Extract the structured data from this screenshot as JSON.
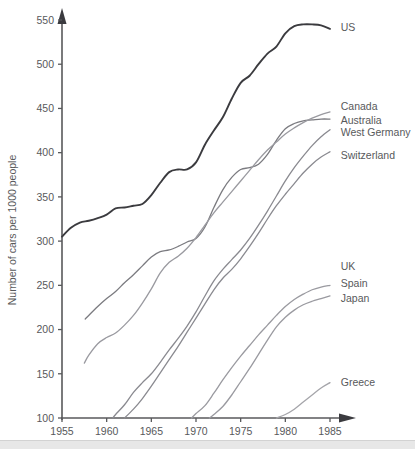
{
  "chart_data": {
    "type": "line",
    "title": "",
    "xlabel": "",
    "ylabel": "Number of cars per 1000 people",
    "xlim": [
      1955,
      1986
    ],
    "ylim": [
      100,
      550
    ],
    "xticks": [
      1955,
      1960,
      1965,
      1970,
      1975,
      1980,
      1985
    ],
    "yticks": [
      100,
      150,
      200,
      250,
      300,
      350,
      400,
      450,
      500,
      550
    ],
    "grid": false,
    "legend_position": "right-inline-labels",
    "series": [
      {
        "name": "US",
        "color": "#3b3b3f",
        "width": 1.9,
        "label_x": 1986.2,
        "label_y": 542,
        "x": [
          1955,
          1956,
          1957,
          1958,
          1959,
          1960,
          1961,
          1962,
          1963,
          1964,
          1965,
          1966,
          1967,
          1968,
          1969,
          1970,
          1971,
          1972,
          1973,
          1974,
          1975,
          1976,
          1977,
          1978,
          1979,
          1980,
          1981,
          1982,
          1983,
          1984,
          1985
        ],
        "y": [
          305,
          315,
          321,
          323,
          326,
          330,
          337,
          338,
          340,
          342,
          352,
          366,
          378,
          381,
          381,
          389,
          409,
          425,
          440,
          461,
          479,
          487,
          500,
          512,
          520,
          535,
          543,
          545,
          545,
          544,
          540
        ]
      },
      {
        "name": "Canada",
        "color": "#7b7b80",
        "width": 1.3,
        "label_x": 1986.2,
        "label_y": 452,
        "x": [
          1957.6,
          1959,
          1960,
          1961,
          1962,
          1963,
          1964,
          1965,
          1966,
          1967,
          1968,
          1969,
          1970,
          1971,
          1972,
          1973,
          1974,
          1975,
          1976,
          1977,
          1978,
          1979,
          1980,
          1981,
          1982,
          1983,
          1984,
          1985
        ],
        "y": [
          212,
          226,
          235,
          243,
          253,
          262,
          272,
          282,
          288,
          290,
          294,
          299,
          303,
          316,
          338,
          358,
          372,
          381,
          383,
          387,
          398,
          414,
          427,
          433,
          436,
          437,
          438,
          438
        ]
      },
      {
        "name": "Australia",
        "color": "#9a9aa0",
        "width": 1.3,
        "label_x": 1986.2,
        "label_y": 437,
        "x": [
          1957.5,
          1958,
          1959,
          1960,
          1961,
          1962,
          1963,
          1964,
          1965,
          1966,
          1967,
          1968,
          1969,
          1970,
          1971,
          1972,
          1973,
          1974,
          1975,
          1976,
          1977,
          1978,
          1979,
          1980,
          1981,
          1982,
          1983,
          1984,
          1985
        ],
        "y": [
          162,
          171,
          184,
          191,
          196,
          205,
          216,
          230,
          246,
          264,
          276,
          283,
          292,
          304,
          318,
          332,
          344,
          356,
          368,
          380,
          392,
          403,
          412,
          421,
          428,
          434,
          439,
          443,
          446
        ]
      },
      {
        "name": "West Germany",
        "color": "#8a8a90",
        "width": 1.3,
        "label_x": 1986.2,
        "label_y": 423,
        "x": [
          1960.7,
          1961,
          1962,
          1963,
          1964,
          1965,
          1966,
          1967,
          1968,
          1969,
          1970,
          1971,
          1972,
          1973,
          1974,
          1975,
          1976,
          1977,
          1978,
          1979,
          1980,
          1981,
          1982,
          1983,
          1984,
          1985
        ],
        "y": [
          100,
          104,
          115,
          129,
          140,
          150,
          163,
          177,
          190,
          204,
          220,
          238,
          255,
          268,
          279,
          290,
          303,
          318,
          334,
          351,
          368,
          383,
          396,
          408,
          418,
          426
        ]
      },
      {
        "name": "Switzerland",
        "color": "#8a8a90",
        "width": 1.3,
        "label_x": 1986.2,
        "label_y": 397,
        "x": [
          1962,
          1963,
          1964,
          1965,
          1966,
          1967,
          1968,
          1969,
          1970,
          1971,
          1972,
          1973,
          1974,
          1975,
          1976,
          1977,
          1978,
          1979,
          1980,
          1981,
          1982,
          1983,
          1984,
          1985
        ],
        "y": [
          100,
          110,
          122,
          136,
          151,
          166,
          181,
          197,
          213,
          229,
          245,
          258,
          268,
          280,
          294,
          309,
          325,
          340,
          353,
          365,
          377,
          387,
          395,
          401
        ]
      },
      {
        "name": "UK",
        "color": "#8a8a90",
        "width": 1.3,
        "label_x": 1986.2,
        "label_y": 272,
        "x": [],
        "y": []
      },
      {
        "name": "Spain",
        "color": "#9a9aa0",
        "width": 1.3,
        "label_x": 1986.2,
        "label_y": 252,
        "x": [
          1969.5,
          1970,
          1971,
          1972,
          1973,
          1974,
          1975,
          1976,
          1977,
          1978,
          1979,
          1980,
          1981,
          1982,
          1983,
          1984,
          1985
        ],
        "y": [
          100,
          105,
          114,
          128,
          143,
          157,
          170,
          182,
          194,
          205,
          216,
          226,
          234,
          240,
          245,
          248,
          250
        ]
      },
      {
        "name": "Japan",
        "color": "#9a9aa0",
        "width": 1.3,
        "label_x": 1986.2,
        "label_y": 235,
        "x": [
          1971.5,
          1972,
          1973,
          1974,
          1975,
          1976,
          1977,
          1978,
          1979,
          1980,
          1981,
          1982,
          1983,
          1984,
          1985
        ],
        "y": [
          100,
          104,
          113,
          126,
          141,
          156,
          172,
          188,
          203,
          214,
          222,
          228,
          232,
          235,
          238
        ]
      },
      {
        "name": "Greece",
        "color": "#a5a5aa",
        "width": 1.3,
        "label_x": 1986.2,
        "label_y": 140,
        "x": [
          1979,
          1980,
          1981,
          1982,
          1983,
          1984,
          1985
        ],
        "y": [
          100,
          104,
          110,
          118,
          126,
          134,
          140
        ]
      }
    ]
  },
  "axis": {
    "y_title": "Number of cars per 1000 people"
  }
}
